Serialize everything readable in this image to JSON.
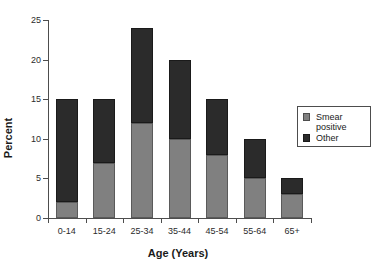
{
  "chart_data": {
    "type": "bar",
    "subtype": "stacked-bar",
    "title": "",
    "xlabel": "Age (Years)",
    "ylabel": "Percent",
    "categories": [
      "0-14",
      "15-24",
      "25-34",
      "35-44",
      "45-54",
      "55-64",
      "65+"
    ],
    "series": [
      {
        "name": "Smear positive",
        "color": "#808080",
        "values": [
          2,
          7,
          12,
          10,
          8,
          5,
          3
        ]
      },
      {
        "name": "Other",
        "color": "#2b2b2b",
        "values": [
          13,
          8,
          12,
          10,
          7,
          5,
          2
        ]
      }
    ],
    "totals": [
      15,
      15,
      24,
      20,
      15,
      10,
      5
    ],
    "ylim": [
      0,
      25
    ],
    "ytick_values": [
      0,
      5,
      10,
      15,
      20,
      25
    ],
    "ytick_labels": [
      "0",
      "5",
      "10",
      "15",
      "20",
      "25"
    ],
    "grid": false,
    "legend_position": "right",
    "legend_entries": [
      {
        "label": "Smear\npositive",
        "swatch": "smear-positive-swatch"
      },
      {
        "label": "Other",
        "swatch": "other-swatch"
      }
    ]
  }
}
